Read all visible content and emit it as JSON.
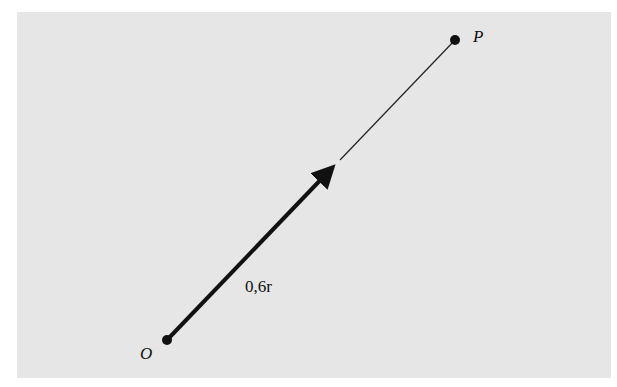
{
  "diagram": {
    "points": [
      {
        "name": "O",
        "label": "O",
        "x": 167,
        "y": 340
      },
      {
        "name": "P",
        "label": "P",
        "x": 455,
        "y": 40
      }
    ],
    "vector": {
      "label": "0,6r",
      "from": "O",
      "fraction": 0.6
    },
    "colors": {
      "background": "#e6e6e6",
      "ink": "#111111",
      "margin": "#ffffff"
    }
  }
}
